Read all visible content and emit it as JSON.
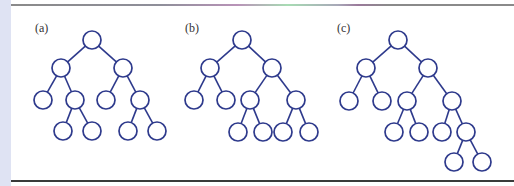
{
  "figure": {
    "panels": [
      {
        "label": "(a)",
        "label_x": 35,
        "nodes": [
          {
            "id": "r",
            "x": 92,
            "y": 40
          },
          {
            "id": "L",
            "x": 61,
            "y": 68
          },
          {
            "id": "R",
            "x": 123,
            "y": 68
          },
          {
            "id": "LL",
            "x": 43,
            "y": 100
          },
          {
            "id": "LR",
            "x": 75,
            "y": 100
          },
          {
            "id": "RL",
            "x": 106,
            "y": 100
          },
          {
            "id": "RR",
            "x": 140,
            "y": 100
          },
          {
            "id": "LRL",
            "x": 63,
            "y": 131
          },
          {
            "id": "LRR",
            "x": 92,
            "y": 131
          },
          {
            "id": "RRL",
            "x": 128,
            "y": 131
          },
          {
            "id": "RRR",
            "x": 157,
            "y": 131
          }
        ],
        "edges": [
          [
            "r",
            "L"
          ],
          [
            "r",
            "R"
          ],
          [
            "L",
            "LL"
          ],
          [
            "L",
            "LR"
          ],
          [
            "R",
            "RL"
          ],
          [
            "R",
            "RR"
          ],
          [
            "LR",
            "LRL"
          ],
          [
            "LR",
            "LRR"
          ],
          [
            "RR",
            "RRL"
          ],
          [
            "RR",
            "RRR"
          ]
        ]
      },
      {
        "label": "(b)",
        "label_x": 185,
        "nodes": [
          {
            "id": "r",
            "x": 242,
            "y": 40
          },
          {
            "id": "L",
            "x": 210,
            "y": 68
          },
          {
            "id": "R",
            "x": 272,
            "y": 68
          },
          {
            "id": "LL",
            "x": 194,
            "y": 100
          },
          {
            "id": "LR",
            "x": 226,
            "y": 100
          },
          {
            "id": "RL",
            "x": 250,
            "y": 100
          },
          {
            "id": "RR",
            "x": 296,
            "y": 100
          },
          {
            "id": "RLL",
            "x": 238,
            "y": 132
          },
          {
            "id": "RLR",
            "x": 263,
            "y": 132
          },
          {
            "id": "RRL",
            "x": 283,
            "y": 132
          },
          {
            "id": "RRR",
            "x": 309,
            "y": 132
          }
        ],
        "edges": [
          [
            "r",
            "L"
          ],
          [
            "r",
            "R"
          ],
          [
            "L",
            "LL"
          ],
          [
            "L",
            "LR"
          ],
          [
            "R",
            "RL"
          ],
          [
            "R",
            "RR"
          ],
          [
            "RL",
            "RLL"
          ],
          [
            "RL",
            "RLR"
          ],
          [
            "RR",
            "RRL"
          ],
          [
            "RR",
            "RRR"
          ]
        ]
      },
      {
        "label": "(c)",
        "label_x": 337,
        "nodes": [
          {
            "id": "r",
            "x": 398,
            "y": 40
          },
          {
            "id": "L",
            "x": 366,
            "y": 68
          },
          {
            "id": "R",
            "x": 428,
            "y": 68
          },
          {
            "id": "LL",
            "x": 349,
            "y": 101
          },
          {
            "id": "LR",
            "x": 382,
            "y": 101
          },
          {
            "id": "RL",
            "x": 407,
            "y": 101
          },
          {
            "id": "RR",
            "x": 452,
            "y": 101
          },
          {
            "id": "RLL",
            "x": 394,
            "y": 132
          },
          {
            "id": "RLR",
            "x": 419,
            "y": 132
          },
          {
            "id": "RRL",
            "x": 442,
            "y": 132
          },
          {
            "id": "RRR",
            "x": 466,
            "y": 132
          },
          {
            "id": "RRRL",
            "x": 454,
            "y": 162
          },
          {
            "id": "RRRR",
            "x": 482,
            "y": 162
          }
        ],
        "edges": [
          [
            "r",
            "L"
          ],
          [
            "r",
            "R"
          ],
          [
            "L",
            "LL"
          ],
          [
            "L",
            "LR"
          ],
          [
            "R",
            "RL"
          ],
          [
            "R",
            "RR"
          ],
          [
            "RL",
            "RLL"
          ],
          [
            "RL",
            "RLR"
          ],
          [
            "RR",
            "RRL"
          ],
          [
            "RR",
            "RRR"
          ],
          [
            "RRR",
            "RRRL"
          ],
          [
            "RRR",
            "RRRR"
          ]
        ]
      }
    ],
    "node_radius": 9,
    "colors": {
      "stroke": "#2e3a8c",
      "node_fill": "#ffffff",
      "background": "#ffffff",
      "left_strip": "#dfe3f3"
    }
  }
}
